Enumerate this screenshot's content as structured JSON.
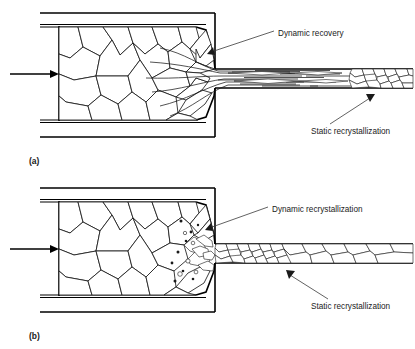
{
  "figure": {
    "background_color": "#ffffff",
    "line_color": "#1a1a1a",
    "width": 415,
    "height": 349
  },
  "panels": [
    {
      "id": "a",
      "label": "(a)",
      "process": "dynamic recovery",
      "annotations": [
        {
          "name": "dynamic-recovery",
          "text": "Dynamic recovery",
          "text_x": 278,
          "text_y": 33,
          "leader_from_x": 274,
          "leader_from_y": 31,
          "leader_to_x": 209,
          "leader_to_y": 53
        },
        {
          "name": "static-recrystallization",
          "text": "Static recrystallization",
          "text_x": 311,
          "text_y": 131,
          "leader_from_x": 330,
          "leader_from_y": 124,
          "leader_to_x": 372,
          "leader_to_y": 96
        }
      ],
      "ram_arrow": {
        "x1": 10,
        "y1": 74,
        "x2": 57,
        "y2": 74
      },
      "extrudate_structure": "elongated fibrous grains becoming equiaxed downstream"
    },
    {
      "id": "b",
      "label": "(b)",
      "process": "dynamic recrystallization",
      "annotations": [
        {
          "name": "dynamic-recrystallization",
          "text": "Dynamic recrystallization",
          "text_x": 272,
          "text_y": 208,
          "leader_from_x": 268,
          "leader_from_y": 207,
          "leader_to_x": 209,
          "leader_to_y": 229
        },
        {
          "name": "static-recrystallization",
          "text": "Static recrystallization",
          "text_x": 311,
          "text_y": 306,
          "leader_from_x": 328,
          "leader_from_y": 299,
          "leader_to_x": 288,
          "leader_to_y": 272
        }
      ],
      "ram_arrow": {
        "x1": 10,
        "y1": 248,
        "x2": 57,
        "y2": 248
      },
      "extrudate_structure": "fine equiaxed recrystallized grains coarsening downstream"
    }
  ],
  "geometry": {
    "container_outer_top_a": 13,
    "container_inner_top_a": 26,
    "container_inner_bottom_a": 122,
    "container_outer_bottom_a": 137,
    "die_left": 205,
    "die_right": 215,
    "extrudate_top_a": 69,
    "extrudate_bottom_a": 88,
    "billet_left": 59,
    "panel_b_offset": 175
  }
}
